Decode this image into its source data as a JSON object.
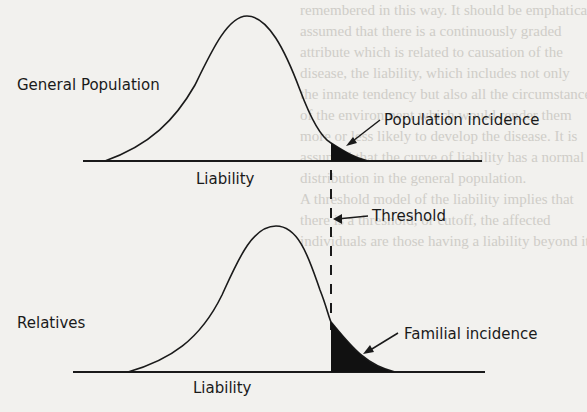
{
  "diagram": {
    "type": "liability-threshold-model",
    "top_panel": {
      "group_label": "General Population",
      "axis_label": "Liability",
      "tail_label": "Population incidence"
    },
    "threshold_label": "Threshold",
    "bottom_panel": {
      "group_label": "Relatives",
      "axis_label": "Liability",
      "tail_label": "Familial incidence"
    },
    "colors": {
      "ink": "#1a1a1a",
      "paper": "#f2f1ee",
      "bleed_text": "#cfcdc8"
    }
  },
  "background_text": [
    "remembered in this way. It should be emphatically",
    "assumed that there is a continuously graded",
    "attribute which is related to causation of the",
    "disease, the liability, which includes not only",
    "the innate tendency but also all the circumstances",
    "of the environment which would render them",
    "more or less likely to develop the disease. It is",
    "assumed that the curve of liability has a normal",
    "distribution in the general population.",
    "A threshold model of the liability implies that",
    "there is a threshold, or cutoff, the affected",
    "individuals are those having a liability beyond it"
  ]
}
